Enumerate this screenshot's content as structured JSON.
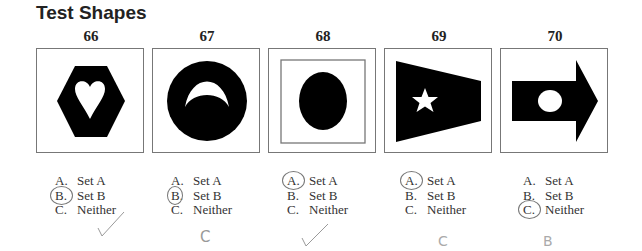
{
  "title": "Test Shapes",
  "items": [
    {
      "number": "66",
      "shape": "hexagon-with-heart-cutout",
      "options": [
        {
          "letter": "A.",
          "label": "Set A"
        },
        {
          "letter": "B.",
          "label": "Set B"
        },
        {
          "letter": "C.",
          "label": "Neither"
        }
      ],
      "selected": "B",
      "grade_mark": "✓"
    },
    {
      "number": "67",
      "shape": "circle-with-crescent-cutout",
      "options": [
        {
          "letter": "A.",
          "label": "Set A"
        },
        {
          "letter": "B.",
          "label": "Set B"
        },
        {
          "letter": "C.",
          "label": "Neither"
        }
      ],
      "selected": "B",
      "grade_mark": "C"
    },
    {
      "number": "68",
      "shape": "oval-in-inner-square",
      "options": [
        {
          "letter": "A.",
          "label": "Set A"
        },
        {
          "letter": "B.",
          "label": "Set B"
        },
        {
          "letter": "C.",
          "label": "Neither"
        }
      ],
      "selected": "A",
      "grade_mark": "✓"
    },
    {
      "number": "69",
      "shape": "trapezoid-flag-with-star",
      "options": [
        {
          "letter": "A.",
          "label": "Set A"
        },
        {
          "letter": "B.",
          "label": "Set B"
        },
        {
          "letter": "C.",
          "label": "Neither"
        }
      ],
      "selected": "A",
      "grade_mark": "C"
    },
    {
      "number": "70",
      "shape": "arrow-with-circle",
      "options": [
        {
          "letter": "A.",
          "label": "Set A"
        },
        {
          "letter": "B.",
          "label": "Set B"
        },
        {
          "letter": "C.",
          "label": "Neither"
        }
      ],
      "selected": "C",
      "grade_mark": "B"
    }
  ]
}
